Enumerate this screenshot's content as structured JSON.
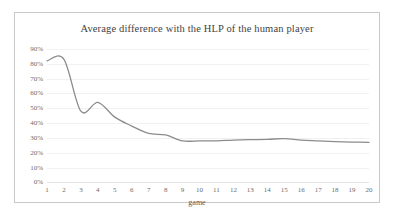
{
  "chart_data": {
    "type": "line",
    "title": "Average difference with the HLP of the human player",
    "xlabel": "game",
    "ylabel": "",
    "x": [
      1,
      2,
      3,
      4,
      5,
      6,
      7,
      8,
      9,
      10,
      11,
      12,
      13,
      14,
      15,
      16,
      17,
      18,
      19,
      20
    ],
    "categories": [
      "1",
      "2",
      "3",
      "4",
      "5",
      "6",
      "7",
      "8",
      "9",
      "10",
      "11",
      "12",
      "13",
      "14",
      "15",
      "16",
      "17",
      "18",
      "19",
      "20"
    ],
    "values": [
      0.82,
      0.83,
      0.48,
      0.54,
      0.44,
      0.38,
      0.33,
      0.32,
      0.28,
      0.28,
      0.28,
      0.285,
      0.288,
      0.29,
      0.295,
      0.285,
      0.28,
      0.275,
      0.272,
      0.27
    ],
    "ylim": [
      0,
      0.9
    ],
    "xlim": [
      1,
      20
    ],
    "ytick_labels": [
      "90%",
      "80%",
      "70%",
      "60%",
      "50%",
      "40%",
      "30%",
      "20%",
      "10%",
      "0%"
    ],
    "ytick_values": [
      0.9,
      0.8,
      0.7,
      0.6,
      0.5,
      0.4,
      0.3,
      0.2,
      0.1,
      0.0
    ],
    "grid": true,
    "legend": false,
    "smoothing": "spline",
    "series_color": "#8c8c8c",
    "gridline_color": "#f1f1f1",
    "border_color": "#c9c9c9",
    "title_color": "#3f3f3f",
    "tick_color": "#6b6b6b"
  }
}
